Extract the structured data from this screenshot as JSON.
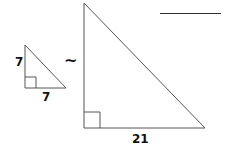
{
  "diagram": {
    "similarity_symbol": "~",
    "small_triangle": {
      "leg_vertical_label": "7",
      "leg_horizontal_label": "7"
    },
    "large_triangle": {
      "leg_horizontal_label": "21"
    },
    "answer_blank": ""
  },
  "colors": {
    "stroke": "#555555",
    "text": "#111111",
    "background": "#ffffff"
  }
}
